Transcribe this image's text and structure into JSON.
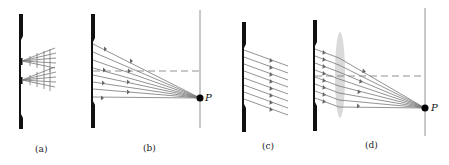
{
  "figure": {
    "panels": [
      {
        "id": "a",
        "label": "(a)",
        "description": "Two narrow slits, each emitting a fan of diffracted rays"
      },
      {
        "id": "b",
        "label": "(b)",
        "description": "Rays from a wide slit converging to point P on a distant screen",
        "point_label": "P"
      },
      {
        "id": "c",
        "label": "(c)",
        "description": "Parallel rays leaving a wide slit at an angle"
      },
      {
        "id": "d",
        "label": "(d)",
        "description": "Parallel rays focused by a lens onto point P",
        "point_label": "P"
      }
    ]
  },
  "colors": {
    "barrier": "#111111",
    "ray": "#777777",
    "lens": "#cfcfcf",
    "point": "#000000"
  }
}
